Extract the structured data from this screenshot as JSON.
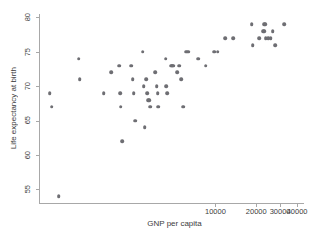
{
  "chart_data": {
    "type": "scatter",
    "title": "",
    "xlabel": "GNP per capita",
    "ylabel": "Life expectancy at birth",
    "xscale": "log",
    "yscale": "linear",
    "grid": false,
    "legend": null,
    "xlim": [
      500,
      45000
    ],
    "ylim": [
      53,
      80.5
    ],
    "xticks": [
      10000,
      20000,
      30000,
      40000
    ],
    "xtick_labels": [
      "10000",
      "20000",
      "30000",
      "40000"
    ],
    "yticks": [
      55,
      60,
      65,
      70,
      75,
      80
    ],
    "ytick_labels": [
      "55",
      "60",
      "65",
      "70",
      "75",
      "80"
    ],
    "marker": {
      "shape": "circle",
      "color": "#6e6e73",
      "size": 3.6
    },
    "axis_color": "#a8a8a8",
    "text_color": "#3c3c3c",
    "background": "#ffffff",
    "points": [
      {
        "x": 600,
        "y": 69
      },
      {
        "x": 620,
        "y": 67
      },
      {
        "x": 700,
        "y": 54
      },
      {
        "x": 980,
        "y": 74
      },
      {
        "x": 1000,
        "y": 71
      },
      {
        "x": 1500,
        "y": 69
      },
      {
        "x": 1700,
        "y": 72
      },
      {
        "x": 1950,
        "y": 73
      },
      {
        "x": 1980,
        "y": 69
      },
      {
        "x": 2000,
        "y": 67
      },
      {
        "x": 2050,
        "y": 62
      },
      {
        "x": 2400,
        "y": 73
      },
      {
        "x": 2450,
        "y": 71
      },
      {
        "x": 2500,
        "y": 69
      },
      {
        "x": 2550,
        "y": 65
      },
      {
        "x": 2900,
        "y": 75
      },
      {
        "x": 2950,
        "y": 70
      },
      {
        "x": 3000,
        "y": 64
      },
      {
        "x": 3100,
        "y": 71
      },
      {
        "x": 3150,
        "y": 69
      },
      {
        "x": 3200,
        "y": 68
      },
      {
        "x": 3250,
        "y": 68
      },
      {
        "x": 3300,
        "y": 67
      },
      {
        "x": 3600,
        "y": 72
      },
      {
        "x": 3700,
        "y": 70
      },
      {
        "x": 3750,
        "y": 69
      },
      {
        "x": 3800,
        "y": 67
      },
      {
        "x": 4300,
        "y": 74
      },
      {
        "x": 4350,
        "y": 70
      },
      {
        "x": 4400,
        "y": 69
      },
      {
        "x": 4700,
        "y": 73
      },
      {
        "x": 4800,
        "y": 73
      },
      {
        "x": 4900,
        "y": 73
      },
      {
        "x": 5200,
        "y": 72
      },
      {
        "x": 5400,
        "y": 73
      },
      {
        "x": 5600,
        "y": 71
      },
      {
        "x": 5800,
        "y": 67
      },
      {
        "x": 6100,
        "y": 75
      },
      {
        "x": 6300,
        "y": 75
      },
      {
        "x": 7500,
        "y": 74
      },
      {
        "x": 8500,
        "y": 73
      },
      {
        "x": 9800,
        "y": 75
      },
      {
        "x": 10400,
        "y": 75
      },
      {
        "x": 11800,
        "y": 77
      },
      {
        "x": 13500,
        "y": 77
      },
      {
        "x": 18500,
        "y": 79
      },
      {
        "x": 18800,
        "y": 76
      },
      {
        "x": 21000,
        "y": 77
      },
      {
        "x": 22500,
        "y": 78
      },
      {
        "x": 22800,
        "y": 78
      },
      {
        "x": 23000,
        "y": 79
      },
      {
        "x": 23200,
        "y": 79
      },
      {
        "x": 23500,
        "y": 77
      },
      {
        "x": 24500,
        "y": 77
      },
      {
        "x": 25500,
        "y": 77
      },
      {
        "x": 26500,
        "y": 78
      },
      {
        "x": 27500,
        "y": 76
      },
      {
        "x": 32000,
        "y": 79
      }
    ]
  }
}
